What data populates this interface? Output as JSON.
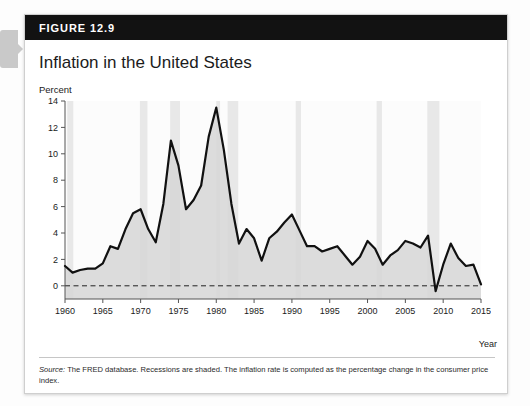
{
  "figure": {
    "number_label": "FIGURE 12.9",
    "title": "Inflation in the United States",
    "y_unit_label": "Percent",
    "x_axis_title": "Year",
    "source_prefix": "Source:",
    "source_text": " The FRED database. Recessions are shaded. The inflation rate is computed as the percentage change in the consumer price index."
  },
  "chart_data": {
    "type": "line",
    "title": "Inflation in the United States",
    "subtitle": "",
    "xlabel": "Year",
    "ylabel": "Percent",
    "xlim": [
      1960,
      2015
    ],
    "ylim": [
      -1,
      14
    ],
    "xticks": [
      1960,
      1965,
      1970,
      1975,
      1980,
      1985,
      1990,
      1995,
      2000,
      2005,
      2010,
      2015
    ],
    "yticks": [
      0,
      2,
      4,
      6,
      8,
      10,
      12,
      14
    ],
    "grid": false,
    "legend": "none",
    "zero_line": 0,
    "zero_line_style": "dashed",
    "area_fill": "#d6d6d6",
    "line_color": "#111111",
    "recession_band_color": "#e8e8e8",
    "series": [
      {
        "name": "Inflation rate (CPI, percent change)",
        "x": [
          1960,
          1961,
          1962,
          1963,
          1964,
          1965,
          1966,
          1967,
          1968,
          1969,
          1970,
          1971,
          1972,
          1973,
          1974,
          1975,
          1976,
          1977,
          1978,
          1979,
          1980,
          1981,
          1982,
          1983,
          1984,
          1985,
          1986,
          1987,
          1988,
          1989,
          1990,
          1991,
          1992,
          1993,
          1994,
          1995,
          1996,
          1997,
          1998,
          1999,
          2000,
          2001,
          2002,
          2003,
          2004,
          2005,
          2006,
          2007,
          2008,
          2009,
          2010,
          2011,
          2012,
          2013,
          2014,
          2015
        ],
        "values": [
          1.5,
          1.0,
          1.2,
          1.3,
          1.3,
          1.7,
          3.0,
          2.8,
          4.3,
          5.5,
          5.8,
          4.3,
          3.3,
          6.2,
          11.0,
          9.1,
          5.8,
          6.5,
          7.6,
          11.3,
          13.5,
          10.3,
          6.2,
          3.2,
          4.3,
          3.6,
          1.9,
          3.6,
          4.1,
          4.8,
          5.4,
          4.2,
          3.0,
          3.0,
          2.6,
          2.8,
          3.0,
          2.3,
          1.6,
          2.2,
          3.4,
          2.8,
          1.6,
          2.3,
          2.7,
          3.4,
          3.2,
          2.9,
          3.8,
          -0.4,
          1.6,
          3.2,
          2.1,
          1.5,
          1.6,
          0.1
        ]
      }
    ],
    "recessions": [
      {
        "start": 1960.3,
        "end": 1961.1
      },
      {
        "start": 1969.9,
        "end": 1970.9
      },
      {
        "start": 1973.9,
        "end": 1975.2
      },
      {
        "start": 1980.0,
        "end": 1980.5
      },
      {
        "start": 1981.5,
        "end": 1982.9
      },
      {
        "start": 1990.5,
        "end": 1991.2
      },
      {
        "start": 2001.2,
        "end": 2001.9
      },
      {
        "start": 2007.9,
        "end": 2009.5
      }
    ]
  }
}
